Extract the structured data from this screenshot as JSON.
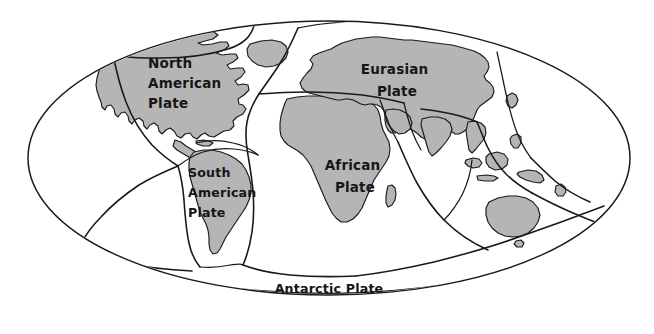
{
  "figure": {
    "type": "map",
    "projection": "elliptical (Mollweide-style) world projection",
    "background_color": "#ffffff",
    "outline_color": "#1a1a1a",
    "land_fill_color": "#b5b5b5",
    "ocean_fill_color": "#ffffff"
  },
  "ellipse": {
    "cx": 329,
    "cy": 158,
    "rx": 301,
    "ry": 137
  },
  "labels": [
    {
      "id": "north-american-plate",
      "lines": [
        "North",
        "American",
        "Plate"
      ],
      "x": 148,
      "y": 68,
      "anchor": "start",
      "line_height": 20
    },
    {
      "id": "eurasian-plate",
      "lines": [
        "Eurasian",
        "Plate"
      ],
      "x": 397,
      "y": 74,
      "anchor": "middle",
      "line_height": 22
    },
    {
      "id": "african-plate",
      "lines": [
        "African",
        "Plate"
      ],
      "x": 355,
      "y": 170,
      "anchor": "middle",
      "line_height": 22
    },
    {
      "id": "south-american-plate",
      "lines": [
        "South",
        "American",
        "Plate"
      ],
      "x": 188,
      "y": 177,
      "anchor": "start",
      "line_height": 20
    },
    {
      "id": "antarctic-plate",
      "lines": [
        "Antarctic Plate"
      ],
      "x": 329,
      "y": 293,
      "anchor": "middle",
      "line_height": 20
    }
  ],
  "plates_named": [
    "North American Plate",
    "Eurasian Plate",
    "African Plate",
    "South American Plate",
    "Antarctic Plate"
  ],
  "landmasses": [
    "North America",
    "Greenland",
    "South America",
    "Africa",
    "Eurasia",
    "India",
    "Arabia",
    "Southeast Asia",
    "Indonesia",
    "Australia",
    "New Guinea",
    "Japan",
    "New Zealand",
    "Madagascar"
  ]
}
